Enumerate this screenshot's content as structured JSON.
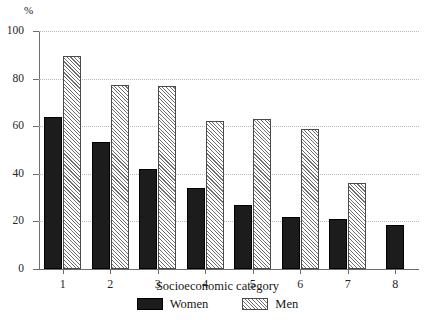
{
  "chart_data": {
    "type": "bar",
    "title": "",
    "subtitle": "",
    "xlabel": "Socioeconomic category",
    "ylabel": "%",
    "categories": [
      "1",
      "2",
      "3",
      "4",
      "5",
      "6",
      "7",
      "8"
    ],
    "series": [
      {
        "name": "Women",
        "values": [
          64,
          53.5,
          42,
          34,
          27,
          22,
          21,
          18.5
        ],
        "color": "#1c1c1c",
        "fill": "solid-black"
      },
      {
        "name": "Men",
        "values": [
          89.5,
          77.5,
          77,
          62,
          63,
          59,
          36,
          null
        ],
        "color": "#6f6f6f",
        "fill": "diagonal-hatch"
      }
    ],
    "ylim": [
      0,
      100
    ],
    "yticks": [
      0,
      20,
      40,
      60,
      80,
      100
    ],
    "ytick_labels": [
      "0",
      "20",
      "40",
      "60",
      "80",
      "100"
    ],
    "grid": "horizontal-dotted",
    "legend_position": "bottom-center"
  },
  "axes": {
    "y_unit": "%",
    "x_title": "Socioeconomic category"
  },
  "legend": {
    "entries": [
      {
        "label": "Women",
        "swatch": "solid-black-swatch"
      },
      {
        "label": "Men",
        "swatch": "hatched-swatch"
      }
    ]
  }
}
